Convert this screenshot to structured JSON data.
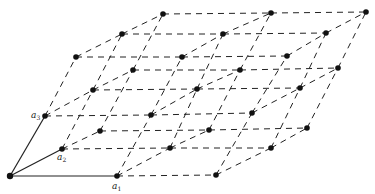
{
  "figure": {
    "kind": "crystal-lattice",
    "grid_size": [
      3,
      3,
      3
    ],
    "colors": {
      "background": "#ffffff",
      "line": "#222222",
      "point": "#111111"
    },
    "points": [
      [
        [
          [
            10,
            176
          ],
          [
            62,
            149
          ],
          [
            100,
            131
          ]
        ],
        [
          [
            45,
            116
          ],
          [
            93,
            90
          ],
          [
            133,
            70
          ]
        ],
        [
          [
            76,
            57
          ],
          [
            122,
            34
          ],
          [
            163,
            14
          ]
        ]
      ],
      [
        [
          [
            117,
            176
          ],
          [
            170,
            148
          ],
          [
            209,
            130
          ]
        ],
        [
          [
            151,
            115
          ],
          [
            197,
            89
          ],
          [
            240,
            70
          ]
        ],
        [
          [
            182,
            57
          ],
          [
            223,
            34
          ],
          [
            271,
            13
          ]
        ]
      ],
      [
        [
          [
            216,
            175
          ],
          [
            271,
            148
          ],
          [
            307,
            128
          ]
        ],
        [
          [
            252,
            113
          ],
          [
            300,
            88
          ],
          [
            338,
            68
          ]
        ],
        [
          [
            287,
            56
          ],
          [
            326,
            33
          ],
          [
            366,
            12
          ]
        ]
      ]
    ],
    "basis_vectors": [
      {
        "name": "a1",
        "symbol": "a",
        "subscript": "1",
        "to": [
          1,
          0,
          0
        ],
        "label_pos": [
          112,
          189
        ]
      },
      {
        "name": "a2",
        "symbol": "a",
        "subscript": "2",
        "to": [
          0,
          1,
          0
        ],
        "label_pos": [
          57,
          160
        ]
      },
      {
        "name": "a3",
        "symbol": "a",
        "subscript": "3",
        "to": [
          0,
          0,
          1
        ],
        "label_pos": [
          31,
          118
        ]
      }
    ]
  }
}
